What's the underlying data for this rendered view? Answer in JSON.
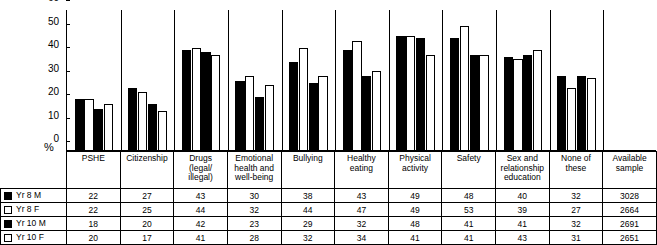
{
  "axis": {
    "y_label": "%",
    "y_ticks": [
      0,
      10,
      20,
      30,
      40,
      50,
      60
    ],
    "y_min": 0,
    "y_max": 60
  },
  "legend": [
    {
      "key": "yr8m",
      "label": "Yr 8 M",
      "style": "filled"
    },
    {
      "key": "yr8f",
      "label": "Yr 8 F",
      "style": "open"
    },
    {
      "key": "yr10m",
      "label": "Yr 10 M",
      "style": "filled"
    },
    {
      "key": "yr10f",
      "label": "Yr 10 F",
      "style": "open"
    }
  ],
  "table": {
    "corner_label": "",
    "available_sample_header": "Available sample",
    "available_sample": [
      3028,
      2664,
      2691,
      2651
    ]
  },
  "chart_data": {
    "type": "bar",
    "title": "",
    "xlabel": "",
    "ylabel": "%",
    "ylim": [
      0,
      60
    ],
    "yticks": [
      0,
      10,
      20,
      30,
      40,
      50,
      60
    ],
    "grid": false,
    "legend_position": "table-left",
    "categories": [
      "PSHE",
      "Citizenship",
      "Drugs (legal/ illegal)",
      "Emotional health and well-being",
      "Bullying",
      "Healthy eating",
      "Physical activity",
      "Safety",
      "Sex and relationship education",
      "None of these"
    ],
    "category_lines": [
      [
        "PSHE"
      ],
      [
        "Citizenship"
      ],
      [
        "Drugs",
        "(legal/",
        "illegal)"
      ],
      [
        "Emotional",
        "health and",
        "well-being"
      ],
      [
        "Bullying"
      ],
      [
        "Healthy",
        "eating"
      ],
      [
        "Physical",
        "activity"
      ],
      [
        "Safety"
      ],
      [
        "Sex and",
        "relationship",
        "education"
      ],
      [
        "None of these"
      ]
    ],
    "series": [
      {
        "name": "Yr 8 M",
        "style": "filled",
        "values": [
          22,
          27,
          43,
          30,
          38,
          43,
          49,
          48,
          40,
          32
        ]
      },
      {
        "name": "Yr 8 F",
        "style": "open",
        "values": [
          22,
          25,
          44,
          32,
          44,
          47,
          49,
          53,
          39,
          27
        ]
      },
      {
        "name": "Yr 10 M",
        "style": "filled",
        "values": [
          18,
          20,
          42,
          23,
          29,
          32,
          48,
          41,
          41,
          32
        ]
      },
      {
        "name": "Yr 10 F",
        "style": "open",
        "values": [
          20,
          17,
          41,
          28,
          32,
          34,
          41,
          41,
          43,
          31
        ]
      }
    ]
  }
}
